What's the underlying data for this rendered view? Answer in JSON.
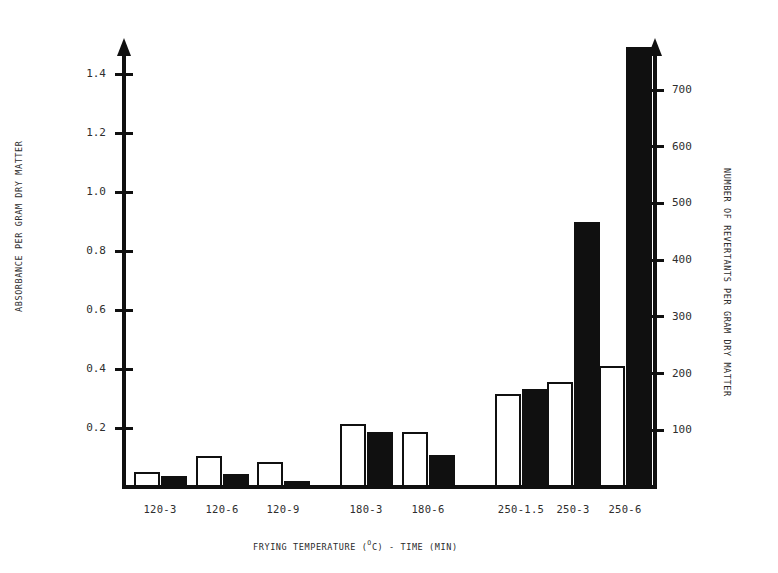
{
  "chart_data": {
    "type": "bar",
    "title": "",
    "xlabel": "FRYING TEMPERATURE (°C) - TIME (MIN)",
    "xlabel_parts": {
      "before": "FRYING TEMPERATURE (",
      "superscript": "O",
      "after": "C) - TIME (MIN)"
    },
    "ylabel": "ABSORBANCE PER GRAM DRY MATTER",
    "ylabel_right": "NUMBER OF REVERTANTS PER GRAM DRY MATTER",
    "categories": [
      "120-3",
      "120-6",
      "120-9",
      "180-3",
      "180-6",
      "250-1.5",
      "250-3",
      "250-6"
    ],
    "series": [
      {
        "name": "absorbance-per-gram-dry-matter",
        "style": "open",
        "axis": "left",
        "values": [
          0.05,
          0.105,
          0.085,
          0.215,
          0.185,
          0.315,
          0.355,
          0.41
        ]
      },
      {
        "name": "number-of-revertants-per-gram-dry-matter",
        "style": "filled",
        "axis": "right",
        "values": [
          20,
          23,
          10,
          97,
          57,
          172,
          468,
          775
        ]
      }
    ],
    "left_axis": {
      "ticks": [
        "0.2",
        "0.4",
        "0.6",
        "0.8",
        "1.0",
        "1.2",
        "1.4"
      ],
      "tick_values": [
        0.2,
        0.4,
        0.6,
        0.8,
        1.0,
        1.2,
        1.4
      ],
      "ylim": [
        0,
        1.52
      ],
      "arrow": true
    },
    "right_axis": {
      "ticks": [
        "100",
        "200",
        "300",
        "400",
        "500",
        "600",
        "700"
      ],
      "tick_values": [
        100,
        200,
        300,
        400,
        500,
        600,
        700
      ],
      "ylim": [
        0,
        760
      ],
      "arrow": true
    },
    "grid": false,
    "legend": null,
    "colors": {
      "open_bar_fill": "#ffffff",
      "filled_bar_fill": "#101010",
      "axis": "#101010",
      "background": "#ffffff"
    }
  }
}
